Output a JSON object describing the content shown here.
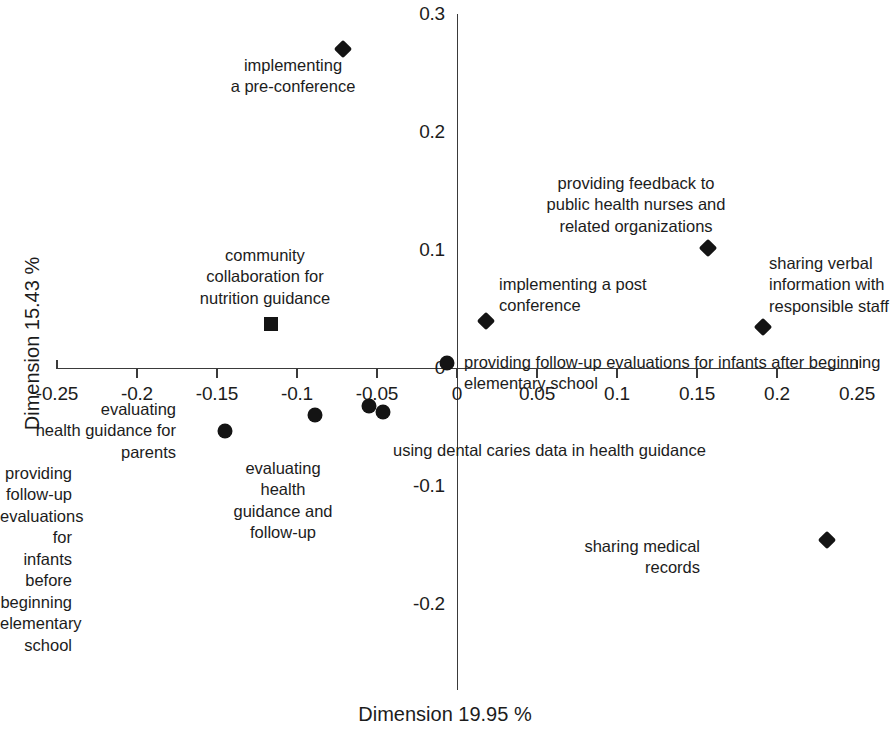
{
  "chart_data": {
    "type": "scatter",
    "title": "",
    "subtitle": "",
    "xlabel": "Dimension 19.95 %",
    "ylabel": "Dimension 15.43 %",
    "xlim": [
      -0.25,
      0.25
    ],
    "ylim": [
      -0.25,
      0.3
    ],
    "grid": false,
    "legend": "none",
    "xticks": [
      "-0.25",
      "-0.2",
      "-0.15",
      "-0.1",
      "-0.05",
      "0",
      "0.05",
      "0.1",
      "0.15",
      "0.2",
      "0.25"
    ],
    "xtick_values": [
      -0.25,
      -0.2,
      -0.15,
      -0.1,
      -0.05,
      0,
      0.05,
      0.1,
      0.15,
      0.2,
      0.25
    ],
    "yticks": [
      "0.3",
      "0.2",
      "0.1",
      "0",
      "-0.1",
      "-0.2"
    ],
    "ytick_values": [
      0.3,
      0.2,
      0.1,
      0,
      -0.1,
      -0.2
    ],
    "points": [
      {
        "label": "implementing\na pre-conference",
        "marker": "diamond",
        "x": -0.071,
        "y": 0.27,
        "label_align": "center",
        "label_x": 293,
        "label_y": 55
      },
      {
        "label": "community\ncollaboration for\nnutrition guidance",
        "marker": "square",
        "x": -0.116,
        "y": 0.037,
        "label_align": "center",
        "label_x": 265,
        "label_y": 245
      },
      {
        "label": "providing feedback to\npublic health nurses and\nrelated organizations",
        "marker": "diamond",
        "x": 0.157,
        "y": 0.102,
        "label_align": "center",
        "label_x": 636,
        "label_y": 173
      },
      {
        "label": "sharing verbal\ninformation with\nresponsible staff",
        "marker": "diamond",
        "x": 0.191,
        "y": 0.035,
        "label_align": "left",
        "label_x": 769,
        "label_y": 253
      },
      {
        "label": "implementing a post\nconference",
        "marker": "diamond",
        "x": 0.018,
        "y": 0.04,
        "label_align": "left",
        "label_x": 499,
        "label_y": 274
      },
      {
        "label": "providing follow-up evaluations for infants after beginning\nelementary school",
        "marker": "circle",
        "x": -0.006,
        "y": 0.004,
        "label_align": "left",
        "label_x": 464,
        "label_y": 352
      },
      {
        "label": "evaluating\nhealth guidance for parents",
        "marker": "circle",
        "x": -0.055,
        "y": -0.032,
        "label_align": "right",
        "label_x": 176,
        "label_y": 399
      },
      {
        "label": "using dental caries data in health guidance",
        "marker": "circle",
        "x": -0.046,
        "y": -0.037,
        "label_align": "left",
        "label_x": 393,
        "label_y": 440
      },
      {
        "label": "evaluating\nhealth\nguidance and\nfollow-up",
        "marker": "circle",
        "x": -0.089,
        "y": -0.04,
        "label_align": "center",
        "label_x": 283,
        "label_y": 458
      },
      {
        "label": "providing follow-up\nevaluations for infants\nbefore beginning\nelementary school",
        "marker": "circle",
        "x": -0.145,
        "y": -0.053,
        "label_align": "right",
        "label_x": 72,
        "label_y": 463
      },
      {
        "label": "sharing medical\nrecords",
        "marker": "diamond",
        "x": 0.231,
        "y": -0.146,
        "label_align": "right",
        "label_x": 700,
        "label_y": 536
      }
    ]
  },
  "axes": {
    "x_title": "Dimension 19.95 %",
    "y_title": "Dimension 15.43 %"
  },
  "colors": {
    "marker": "#141414",
    "axis": "#3a3a3a",
    "text": "#1c1c1c",
    "background": "#ffffff"
  }
}
